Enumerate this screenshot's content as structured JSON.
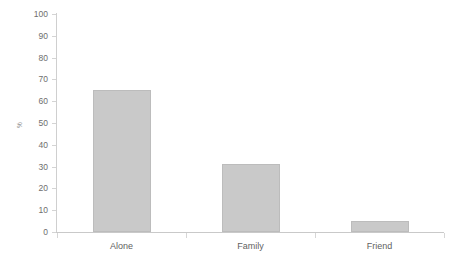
{
  "chart_data": {
    "type": "bar",
    "title": "",
    "subtitle": "",
    "xlabel": "",
    "ylabel": "%",
    "categories": [
      "Alone",
      "Family",
      "Friend"
    ],
    "values": [
      65,
      31,
      5
    ],
    "ylim": [
      0,
      100
    ],
    "ytick_labels": [
      "0",
      "10",
      "20",
      "30",
      "40",
      "50",
      "60",
      "70",
      "80",
      "90",
      "100"
    ],
    "ytick_values": [
      0,
      10,
      20,
      30,
      40,
      50,
      60,
      70,
      80,
      90,
      100
    ],
    "grid": false,
    "legend": null,
    "legend_position": "none",
    "annotations": [],
    "series": [
      {
        "name": "%",
        "values": [
          65,
          31,
          5
        ]
      }
    ],
    "colors": {
      "bar_fill": "#c9c9c9",
      "bar_border": "#bcbcbc",
      "axis_line": "#c9c9c9",
      "tick_mark": "#d4d4d4",
      "tick_label": "#6e6e6e",
      "category_label": "#5f5f5f",
      "background": "#ffffff"
    }
  }
}
